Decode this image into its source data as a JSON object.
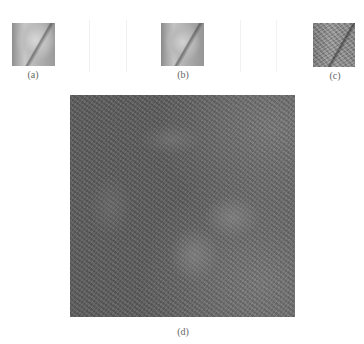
{
  "figure": {
    "panels": [
      {
        "id": "a",
        "label": "(a)",
        "description": "original grayscale image (small)"
      },
      {
        "id": "b",
        "label": "(b)",
        "description": "processed grayscale image (small)"
      },
      {
        "id": "c",
        "label": "(c)",
        "description": "noisy/textured grayscale image (small)"
      },
      {
        "id": "d",
        "label": "(d)",
        "description": "enlarged noisy grayscale image with faint circular blobs"
      }
    ]
  }
}
